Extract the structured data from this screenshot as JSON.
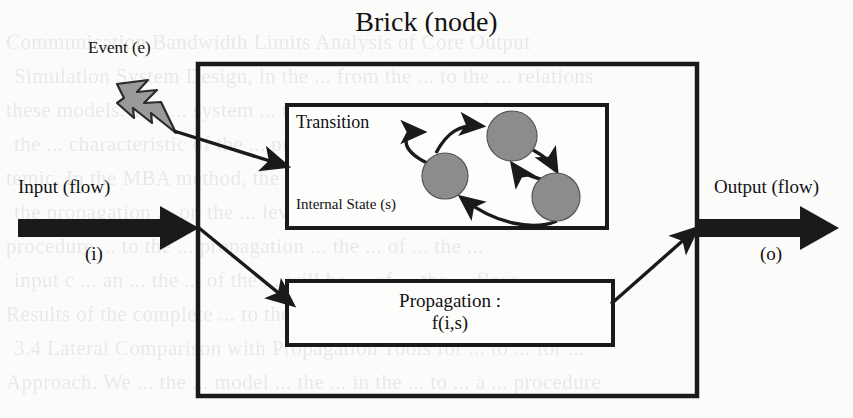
{
  "figure": {
    "title": "Brick (node)",
    "background_color": "#fbfbfa",
    "ink_color": "#1a1a1a",
    "state_fill_color": "#8c8c8c",
    "bolt_fill_color": "#9a9a9a"
  },
  "labels": {
    "event": "Event (e)",
    "input": "Input (flow)",
    "input_symbol": "(i)",
    "output": "Output (flow)",
    "output_symbol": "(o)",
    "transition": "Transition",
    "internal_state": "Internal State (s)",
    "propagation": "Propagation :",
    "propagation_formula": "f(i,s)"
  },
  "boxes": {
    "outer": {
      "name": "brick-node",
      "x": 198,
      "y": 64,
      "width": 499,
      "height": 332
    },
    "transition": {
      "name": "transition-box",
      "x": 287,
      "y": 105,
      "width": 320,
      "height": 123
    },
    "propagation": {
      "name": "propagation-box",
      "x": 287,
      "y": 281,
      "width": 326,
      "height": 64
    }
  },
  "states": [
    {
      "id": "s1",
      "cx": 445,
      "cy": 176,
      "r": 23
    },
    {
      "id": "s2",
      "cx": 512,
      "cy": 136,
      "r": 25
    },
    {
      "id": "s3",
      "cx": 556,
      "cy": 197,
      "r": 24
    }
  ],
  "state_transitions": [
    {
      "from": "s1",
      "to": "s1",
      "kind": "self-loop"
    },
    {
      "from": "s1",
      "to": "s2",
      "kind": "curve"
    },
    {
      "from": "s2",
      "to": "s3",
      "kind": "curve"
    },
    {
      "from": "s3",
      "to": "s2",
      "kind": "curve"
    },
    {
      "from": "s3",
      "to": "s1",
      "kind": "curve"
    }
  ],
  "flows": [
    {
      "name": "input-flow-arrow",
      "kind": "thick",
      "from": [
        18,
        228
      ],
      "to": [
        198,
        228
      ]
    },
    {
      "name": "output-flow-arrow",
      "kind": "thick",
      "from": [
        697,
        228
      ],
      "to": [
        838,
        228
      ]
    },
    {
      "name": "event-to-transition-arrow",
      "kind": "thin",
      "from": [
        176,
        133
      ],
      "to": [
        285,
        166
      ]
    },
    {
      "name": "input-to-propagation-arrow",
      "kind": "thin",
      "from": [
        198,
        228
      ],
      "to": [
        291,
        303
      ]
    },
    {
      "name": "propagation-to-output-arrow",
      "kind": "thin",
      "from": [
        613,
        302
      ],
      "to": [
        695,
        230
      ]
    }
  ],
  "bleed_text": {
    "lines": [
      "Communication Bandwidth Limits Analysis of Core Output",
      "Simulation System Design, in the ... from the ... to the ... relations",
      "these models. The ... system ... the ... to ... a number of ... and ...",
      "the ... characteristic of the ... propagation to the ... of a ... sys-",
      "temic. In the MBA method, the ... values found from the analyses",
      "the propagation ... on the ... level ... of ... to the ... for a ...",
      "procedure ... to the ... propagation ... the ... of ... the ...",
      "input c ... an ... the ... of the ... will be ... of ... the ... flow ...",
      "Results of the complete ... to the ... of ... systems",
      "3.4 Lateral Comparison with Propagation Tools for ... to ... for ...",
      "Approach. We ... the ... model ... the ... in the ... to ... a ... procedure"
    ]
  }
}
